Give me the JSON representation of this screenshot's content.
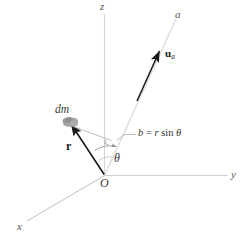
{
  "figure": {
    "colors": {
      "axis_light": "#d8d8d8",
      "axis_mid": "#bfbfbf",
      "vector_dark": "#1a1a1a",
      "helper_gray": "#b0b0b0",
      "mass_blob": "#9a9a9a",
      "text": "#3a3a3a",
      "background": "#ffffff"
    },
    "axes": [
      {
        "name": "z",
        "label": "z"
      },
      {
        "name": "y",
        "label": "y"
      },
      {
        "name": "x",
        "label": "x"
      },
      {
        "name": "a",
        "label": "a"
      }
    ],
    "labels": {
      "z_axis": "z",
      "y_axis": "y",
      "x_axis": "x",
      "a_axis": "a",
      "origin": "O",
      "mass_element": "dm",
      "position_vector": "r",
      "unit_vector": "u",
      "unit_vector_subscript": "a",
      "theta": "θ",
      "perpendicular_distance": "b = r sin θ",
      "perp_b": "b",
      "perp_equals": "=",
      "perp_r": "r",
      "perp_sin": "sin",
      "perp_theta": "θ"
    }
  }
}
